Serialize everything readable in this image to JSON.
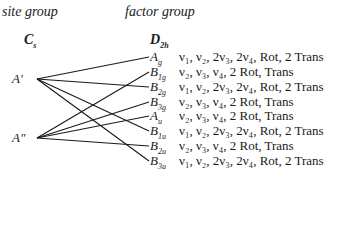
{
  "headers": {
    "site_group": "site group",
    "factor_group": "factor group"
  },
  "site_group": {
    "name": "C",
    "sub": "s",
    "species": [
      {
        "label": "A′",
        "id": "A1",
        "y": 79
      },
      {
        "label": "A″",
        "id": "A2",
        "y": 138
      }
    ]
  },
  "factor_group": {
    "name": "D",
    "sub": "2h",
    "species": [
      {
        "label": "A",
        "sub": "g",
        "y": 57,
        "modes": "ν₁, ν₂, 2ν₃, 2ν₄, Rot, 2 Trans"
      },
      {
        "label": "B",
        "sub": "1g",
        "y": 72,
        "modes": "ν₂, ν₃, ν₄, 2 Rot, Trans"
      },
      {
        "label": "B",
        "sub": "2g",
        "y": 87,
        "modes": "ν₁, ν₂, 2ν₃, 2ν₄, Rot, 2 Trans"
      },
      {
        "label": "B",
        "sub": "3g",
        "y": 102,
        "modes": "ν₂, ν₃, ν₄, 2 Rot, Trans"
      },
      {
        "label": "A",
        "sub": "u",
        "y": 116,
        "modes": "ν₂, ν₃, ν₄, 2 Rot, Trans"
      },
      {
        "label": "B",
        "sub": "1u",
        "y": 131,
        "modes": "ν₁, ν₂, 2ν₃, 2ν₄, Rot, 2 Trans"
      },
      {
        "label": "B",
        "sub": "2u",
        "y": 146,
        "modes": "ν₂, ν₃, ν₄, 2 Rot, Trans"
      },
      {
        "label": "B",
        "sub": "3u",
        "y": 161,
        "modes": "ν₁, ν₂, 2ν₃, 2ν₄, Rot, 2 Trans"
      }
    ]
  },
  "correlations": [
    {
      "from": "A1",
      "to": 0
    },
    {
      "from": "A1",
      "to": 2
    },
    {
      "from": "A1",
      "to": 5
    },
    {
      "from": "A1",
      "to": 7
    },
    {
      "from": "A2",
      "to": 1
    },
    {
      "from": "A2",
      "to": 3
    },
    {
      "from": "A2",
      "to": 4
    },
    {
      "from": "A2",
      "to": 6
    }
  ]
}
